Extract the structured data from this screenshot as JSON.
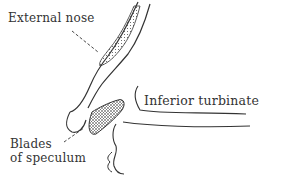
{
  "figure": {
    "type": "anatomical line drawing",
    "labels": {
      "external_nose": "External nose",
      "inferior_turbinate": "Inferior turbinate",
      "blades_line1": "Blades",
      "blades_line2": "of speculum"
    },
    "colors": {
      "ink": "#333333",
      "background": "#ffffff"
    }
  }
}
